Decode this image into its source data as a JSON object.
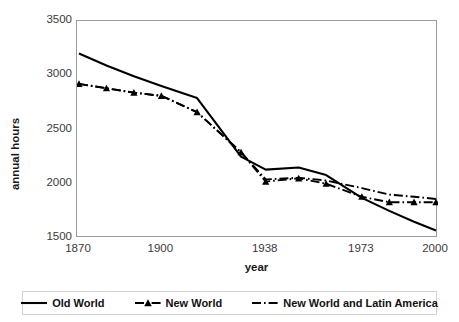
{
  "chart_data": {
    "type": "line",
    "title": "",
    "xlabel": "year",
    "ylabel": "annual hours",
    "ylim": [
      1500,
      3500
    ],
    "yticks": [
      1500,
      2000,
      2500,
      3000,
      3500
    ],
    "xtick_labels": [
      "1870",
      "1900",
      "1938",
      "1973",
      "2000"
    ],
    "xtick_positions": [
      1870,
      1900,
      1938,
      1973,
      2000
    ],
    "grid": false,
    "legend_position": "bottom",
    "x": [
      1870,
      1880,
      1890,
      1900,
      1913,
      1929,
      1938,
      1950,
      1960,
      1973,
      1983,
      1992,
      2000
    ],
    "series": [
      {
        "name": "Old World",
        "style": "solid",
        "marker": "none",
        "color": "#000000",
        "values": [
          3200,
          3090,
          2990,
          2900,
          2790,
          2250,
          2130,
          2150,
          2080,
          1870,
          1750,
          1650,
          1570
        ]
      },
      {
        "name": "New World",
        "style": "dash-dot",
        "marker": "triangle",
        "color": "#000000",
        "values": [
          2920,
          2880,
          2840,
          2810,
          2660,
          2290,
          2020,
          2050,
          2000,
          1880,
          1830,
          1830,
          1830
        ]
      },
      {
        "name": "New World and Latin America",
        "style": "dash-dot",
        "marker": "none",
        "color": "#000000",
        "values": [
          2920,
          2880,
          2840,
          2810,
          2660,
          2290,
          2040,
          2055,
          2030,
          1960,
          1900,
          1880,
          1860
        ]
      }
    ]
  },
  "axes": {
    "y_title": "annual hours",
    "x_title": "year",
    "y_tick_labels": [
      "3500",
      "3000",
      "2500",
      "2000",
      "1500"
    ],
    "x_tick_labels": [
      "1870",
      "1900",
      "1938",
      "1973",
      "2000"
    ]
  },
  "legend": {
    "items": [
      {
        "label": "Old World",
        "swatch": "solid-line-swatch"
      },
      {
        "label": "New World",
        "swatch": "dashdot-triangle-swatch"
      },
      {
        "label": "New World and Latin America",
        "swatch": "dashdot-line-swatch"
      }
    ]
  }
}
